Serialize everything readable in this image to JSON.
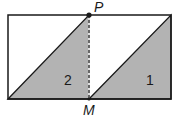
{
  "diagram": {
    "colors": {
      "stroke": "#1a1a1a",
      "shade": "#b3b3b3",
      "background": "#ffffff"
    },
    "rectangle": {
      "x1": 8,
      "y1": 15,
      "x2": 171,
      "y2": 99
    },
    "points": {
      "P": {
        "label": "P",
        "x": 89,
        "y": 15
      },
      "M": {
        "label": "M",
        "x": 89,
        "y": 99
      }
    },
    "regions": [
      {
        "label": "2",
        "vertices": [
          [
            8,
            99
          ],
          [
            89,
            15
          ],
          [
            89,
            99
          ]
        ]
      },
      {
        "label": "1",
        "vertices": [
          [
            89,
            99
          ],
          [
            171,
            15
          ],
          [
            171,
            99
          ]
        ]
      }
    ],
    "divider": {
      "style": "dashed",
      "from": "P",
      "to": "M"
    }
  }
}
